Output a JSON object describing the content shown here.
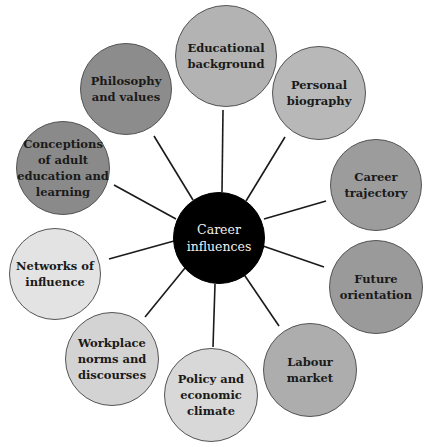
{
  "diagram": {
    "title": "Career influences",
    "center": {
      "label": "Career\ninfluences",
      "x": 219,
      "y": 238,
      "r": 46,
      "fill": "#000000"
    },
    "nodes": [
      {
        "id": "educational-background",
        "label": "Educational\nbackground",
        "x": 226,
        "y": 56,
        "r": 51,
        "fill": "#b3b3b3",
        "link_from": [
          222,
          192
        ],
        "link_to": [
          223,
          110
        ]
      },
      {
        "id": "personal-biography",
        "label": "Personal\nbiography",
        "x": 319,
        "y": 93,
        "r": 47,
        "fill": "#b8b8b8",
        "link_from": [
          246,
          201
        ],
        "link_to": [
          285,
          137
        ]
      },
      {
        "id": "career-trajectory",
        "label": "Career\ntrajectory",
        "x": 376,
        "y": 185,
        "r": 46,
        "fill": "#9c9c9c",
        "link_from": [
          264,
          219
        ],
        "link_to": [
          326,
          201
        ]
      },
      {
        "id": "future-orientation",
        "label": "Future\norientation",
        "x": 376,
        "y": 287,
        "r": 47,
        "fill": "#9a9a9a",
        "link_from": [
          263,
          246
        ],
        "link_to": [
          324,
          267
        ]
      },
      {
        "id": "labour-market",
        "label": "Labour market",
        "x": 310,
        "y": 370,
        "r": 47,
        "fill": "#adadad",
        "link_from": [
          243,
          273
        ],
        "link_to": [
          279,
          326
        ]
      },
      {
        "id": "policy-and-economic-climate",
        "label": "Policy and\neconomic\nclimate",
        "x": 211,
        "y": 395,
        "r": 47,
        "fill": "#d8d8d8",
        "link_from": [
          215,
          284
        ],
        "link_to": [
          213,
          347
        ]
      },
      {
        "id": "workplace-norms-and-discourses",
        "label": "Workplace\nnorms and\ndiscourses",
        "x": 112,
        "y": 359,
        "r": 47,
        "fill": "#d3d3d3",
        "link_from": [
          185,
          268
        ],
        "link_to": [
          145,
          317
        ]
      },
      {
        "id": "networks-of-influence",
        "label": "Networks of\ninfluence",
        "x": 55,
        "y": 274,
        "r": 46,
        "fill": "#e3e3e3",
        "link_from": [
          174,
          241
        ],
        "link_to": [
          109,
          259
        ]
      },
      {
        "id": "conceptions-of-adult-education-and-learning",
        "label": "Conceptions\nof adult\neducation and\nlearning",
        "x": 63,
        "y": 168,
        "r": 47,
        "fill": "#8a8a8a",
        "link_from": [
          176,
          219
        ],
        "link_to": [
          114,
          185
        ]
      },
      {
        "id": "philosophy-and-values",
        "label": "Philosophy\nand values",
        "x": 126,
        "y": 89,
        "r": 46,
        "fill": "#8c8c8c",
        "link_from": [
          193,
          200
        ],
        "link_to": [
          154,
          136
        ]
      }
    ],
    "line_color": "#1a1a1a"
  }
}
